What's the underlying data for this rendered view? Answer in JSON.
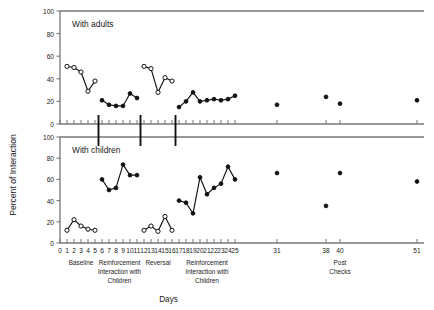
{
  "figure": {
    "ylabel": "Percent of Interaction",
    "xlabel": "Days",
    "panels": [
      {
        "title": "With adults"
      },
      {
        "title": "With children"
      }
    ],
    "y_ticks": [
      "0",
      "20",
      "40",
      "60",
      "80",
      "100"
    ],
    "x_ticks": [
      "0",
      "1",
      "2",
      "3",
      "4",
      "5",
      "6",
      "7",
      "8",
      "9",
      "10",
      "11",
      "12",
      "13",
      "14",
      "15",
      "16",
      "17",
      "18",
      "19",
      "20",
      "21",
      "22",
      "23",
      "24",
      "25",
      "31",
      "38",
      "40",
      "51"
    ],
    "phases": [
      {
        "label": "Baseline",
        "lines": [
          "Baseline"
        ]
      },
      {
        "label": "Reinforcement Interaction with Children",
        "lines": [
          "Reinforcement",
          "Interaction with",
          "Children"
        ]
      },
      {
        "label": "Reversal",
        "lines": [
          "Reversal"
        ]
      },
      {
        "label": "Reinforcement Interaction with Children",
        "lines": [
          "Reinforcement",
          "Interaction with",
          "Children"
        ]
      },
      {
        "label": "Post Checks",
        "lines": [
          "Post",
          "Checks"
        ]
      }
    ],
    "colors": {
      "line": "#111111",
      "axis": "#777777",
      "marker_fill": "#111111",
      "marker_open": "#ffffff"
    }
  },
  "chart_data": {
    "type": "line",
    "xlabel": "Days",
    "ylabel": "Percent of Interaction",
    "xlim": [
      0,
      52
    ],
    "ylim": [
      0,
      100
    ],
    "grid": false,
    "legend": "none",
    "panels": [
      {
        "name": "With adults",
        "series": [
          {
            "name": "Baseline",
            "marker": "open-circle",
            "x": [
              1,
              2,
              3,
              4,
              5
            ],
            "y": [
              51,
              50,
              46,
              29,
              38
            ]
          },
          {
            "name": "Reinforcement Interaction with Children",
            "marker": "filled-circle",
            "x": [
              6,
              7,
              8,
              9,
              10,
              11
            ],
            "y": [
              21,
              17,
              16,
              16,
              27,
              23
            ]
          },
          {
            "name": "Reversal",
            "marker": "open-circle",
            "x": [
              12,
              13,
              14,
              15,
              16
            ],
            "y": [
              51,
              49,
              28,
              41,
              38
            ]
          },
          {
            "name": "Reinforcement Interaction with Children (2)",
            "marker": "filled-circle",
            "x": [
              17,
              18,
              19,
              20,
              21,
              22,
              23,
              24,
              25
            ],
            "y": [
              15,
              20,
              28,
              20,
              21,
              22,
              21,
              22,
              25
            ]
          },
          {
            "name": "Post Checks",
            "marker": "filled-circle-unconnected",
            "x": [
              31,
              38,
              40,
              51
            ],
            "y": [
              17,
              24,
              18,
              21
            ]
          }
        ]
      },
      {
        "name": "With children",
        "series": [
          {
            "name": "Baseline",
            "marker": "open-circle",
            "x": [
              1,
              2,
              3,
              4,
              5
            ],
            "y": [
              12,
              22,
              16,
              13,
              12
            ]
          },
          {
            "name": "Reinforcement Interaction with Children",
            "marker": "filled-circle",
            "x": [
              6,
              7,
              8,
              9,
              10,
              11
            ],
            "y": [
              60,
              50,
              52,
              74,
              64,
              64
            ]
          },
          {
            "name": "Reversal",
            "marker": "open-circle",
            "x": [
              12,
              13,
              14,
              15,
              16
            ],
            "y": [
              12,
              16,
              11,
              25,
              12
            ]
          },
          {
            "name": "Reinforcement Interaction with Children (2)",
            "marker": "filled-circle",
            "x": [
              17,
              18,
              19,
              20,
              21,
              22,
              23,
              24,
              25
            ],
            "y": [
              40,
              38,
              28,
              62,
              46,
              52,
              56,
              72,
              60
            ]
          },
          {
            "name": "Post Checks",
            "marker": "filled-circle-unconnected",
            "x": [
              31,
              38,
              40,
              51
            ],
            "y": [
              66,
              35,
              66,
              58
            ]
          }
        ]
      }
    ]
  }
}
